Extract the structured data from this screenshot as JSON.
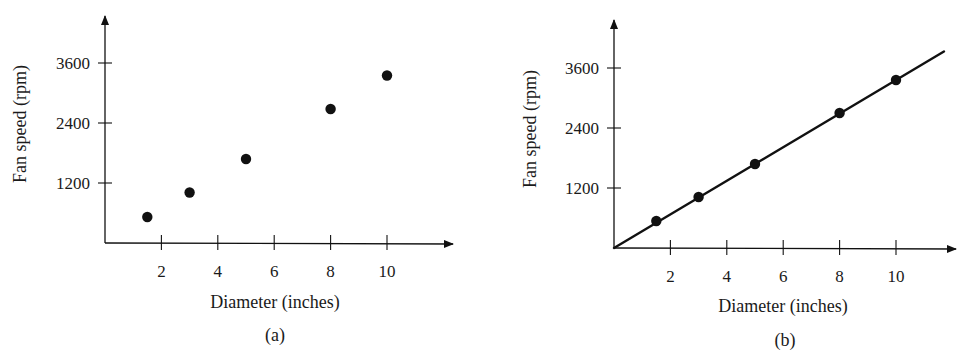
{
  "figure": {
    "colors": {
      "ink": "#111111",
      "background": "#ffffff"
    }
  },
  "chart_data": [
    {
      "type": "scatter",
      "panel_label": "(a)",
      "title": "",
      "xlabel": "Diameter (inches)",
      "ylabel": "Fan speed (rpm)",
      "xlim": [
        0,
        12
      ],
      "ylim": [
        0,
        4800
      ],
      "x_ticks": [
        2,
        4,
        6,
        8,
        10
      ],
      "x_tick_labels": [
        "2",
        "4",
        "6",
        "8",
        "10"
      ],
      "y_ticks": [
        1200,
        2400,
        3600
      ],
      "y_tick_labels": [
        "1200",
        "2400",
        "3600"
      ],
      "grid": false,
      "legend": null,
      "series": [
        {
          "name": "Measured fan speed",
          "x": [
            1.5,
            3,
            5,
            8,
            10
          ],
          "y": [
            520,
            1010,
            1680,
            2680,
            3350
          ]
        }
      ],
      "fit_line": null,
      "layout": {
        "origin_px": [
          105,
          243
        ],
        "px_per_x": 28.2,
        "px_per_y": 0.05,
        "y_axis_top_px": 16,
        "x_axis_end_px": 453,
        "xlabel_pos": [
          275,
          308
        ],
        "ylabel_pos": [
          26,
          124
        ],
        "panel_label_pos": [
          275,
          341
        ]
      }
    },
    {
      "type": "scatter",
      "panel_label": "(b)",
      "title": "",
      "xlabel": "Diameter (inches)",
      "ylabel": "Fan speed (rpm)",
      "xlim": [
        0,
        12
      ],
      "ylim": [
        0,
        4800
      ],
      "x_ticks": [
        2,
        4,
        6,
        8,
        10
      ],
      "x_tick_labels": [
        "2",
        "4",
        "6",
        "8",
        "10"
      ],
      "y_ticks": [
        1200,
        2400,
        3600
      ],
      "y_tick_labels": [
        "1200",
        "2400",
        "3600"
      ],
      "grid": false,
      "legend": null,
      "series": [
        {
          "name": "Measured fan speed",
          "x": [
            1.5,
            3,
            5,
            8,
            10
          ],
          "y": [
            540,
            1020,
            1680,
            2700,
            3360
          ]
        }
      ],
      "fit_line": {
        "description": "Line through origin fitting the data",
        "slope_rpm_per_inch": 336,
        "x_start": 0,
        "x_end": 11.7
      },
      "layout": {
        "origin_px": [
          614,
          248
        ],
        "px_per_x": 28.2,
        "px_per_y": 0.05,
        "y_axis_top_px": 20,
        "x_axis_end_px": 956,
        "xlabel_pos": [
          783,
          312
        ],
        "ylabel_pos": [
          536,
          129
        ],
        "panel_label_pos": [
          785,
          346
        ]
      }
    }
  ]
}
